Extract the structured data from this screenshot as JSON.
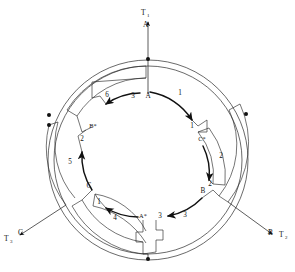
{
  "figure": {
    "type": "three-phase-motor-winding-diagram"
  },
  "terminals": [
    {
      "id": "T1",
      "name": "T1",
      "label": "T",
      "sub": "1",
      "phase": "A",
      "x": 148,
      "y": 14,
      "phase_x": 148,
      "phase_y": 24,
      "dir": "up"
    },
    {
      "id": "T2",
      "name": "T2",
      "label": "T",
      "sub": "2",
      "phase": "B",
      "x": 275,
      "y": 233,
      "phase_x": 262,
      "phase_y": 230,
      "dir": "down-right"
    },
    {
      "id": "T3",
      "name": "T3",
      "label": "T",
      "sub": "3",
      "phase": "C",
      "x": 12,
      "y": 233,
      "phase_x": 27,
      "phase_y": 228,
      "dir": "down-left"
    }
  ],
  "inner_labels": [
    {
      "text": "A",
      "x": 148,
      "y": 98
    },
    {
      "text": "1",
      "x": 180,
      "y": 95
    },
    {
      "text": "1",
      "x": 192,
      "y": 128
    },
    {
      "text": "C*",
      "x": 202,
      "y": 141
    },
    {
      "text": "2",
      "x": 221,
      "y": 158
    },
    {
      "text": "2",
      "x": 210,
      "y": 186
    },
    {
      "text": "B",
      "x": 203,
      "y": 193
    },
    {
      "text": "3",
      "x": 185,
      "y": 217
    },
    {
      "text": "3",
      "x": 160,
      "y": 218
    },
    {
      "text": "A*",
      "x": 143,
      "y": 218
    },
    {
      "text": "4",
      "x": 115,
      "y": 220
    },
    {
      "text": "1",
      "x": 99,
      "y": 204
    },
    {
      "text": "C",
      "x": 89,
      "y": 188
    },
    {
      "text": "5",
      "x": 70,
      "y": 164
    },
    {
      "text": "2",
      "x": 82,
      "y": 141
    },
    {
      "text": "B*",
      "x": 93,
      "y": 128
    },
    {
      "text": "6",
      "x": 107,
      "y": 97
    },
    {
      "text": "3",
      "x": 133,
      "y": 98
    }
  ],
  "connection_dots": [
    {
      "x": 49,
      "y": 115,
      "name": "junction-left-upper"
    },
    {
      "x": 49,
      "y": 125,
      "name": "junction-left-lower"
    },
    {
      "x": 246,
      "y": 114,
      "name": "junction-right-upper"
    },
    {
      "x": 148,
      "y": 59,
      "name": "junction-top"
    },
    {
      "x": 148,
      "y": 259,
      "name": "junction-bottom"
    }
  ],
  "colors": {
    "ink": "#111111",
    "line": "#2a2a2a",
    "background": "#ffffff"
  }
}
